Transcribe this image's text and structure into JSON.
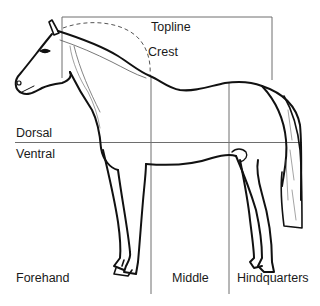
{
  "diagram": {
    "labels": {
      "topline": "Topline",
      "crest": "Crest",
      "dorsal": "Dorsal",
      "ventral": "Ventral",
      "forehand": "Forehand",
      "middle": "Middle",
      "hindquarters": "Hindquarters"
    },
    "colors": {
      "grid_line": "#6e6e6e",
      "outline": "#111111",
      "text": "#1a1a1a",
      "background": "#ffffff"
    }
  }
}
